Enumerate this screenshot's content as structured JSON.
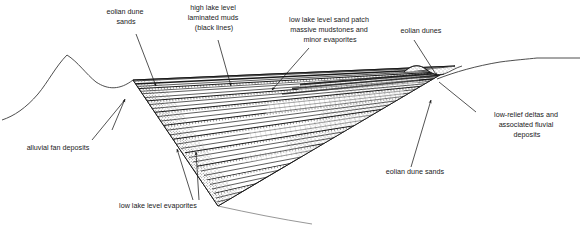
{
  "figure": {
    "type": "geological-cross-section",
    "background_color": "#ffffff",
    "line_color": "#1a1a1a",
    "stipple_color": "#555555",
    "width": 582,
    "height": 240
  },
  "labels": {
    "eolian_dune_sands_top": {
      "lines": [
        "eolian dune",
        "sands"
      ],
      "x": 126,
      "y": 14,
      "anchor": "middle"
    },
    "high_lake_level_muds": {
      "lines": [
        "high lake level",
        "laminated muds",
        "(black lines)"
      ],
      "x": 214,
      "y": 8,
      "anchor": "middle"
    },
    "low_lake_level_sand_patch": {
      "lines": [
        "low lake level sand patch",
        "massive mudstones and",
        "minor evaporites"
      ],
      "x": 330,
      "y": 22,
      "anchor": "middle"
    },
    "eolian_dunes_top_right": {
      "lines": [
        "eolian dunes"
      ],
      "x": 421,
      "y": 33,
      "anchor": "middle"
    },
    "low_relief_deltas": {
      "lines": [
        "low-relief deltas and",
        "associated fluvial",
        "deposits"
      ],
      "x": 527,
      "y": 117,
      "anchor": "middle"
    },
    "eolian_dune_sands_bottom": {
      "lines": [
        "eolian dune sands"
      ],
      "x": 415,
      "y": 174,
      "anchor": "middle"
    },
    "low_lake_level_evaporites": {
      "lines": [
        "low lake level evaporites"
      ],
      "x": 158,
      "y": 208,
      "anchor": "middle"
    },
    "alluvial_fan_deposits": {
      "lines": [
        "alluvial fan deposits"
      ],
      "x": 58,
      "y": 150,
      "anchor": "middle"
    }
  },
  "leaders": {
    "eolian_dune_sands_top": {
      "x1": 136,
      "y1": 34,
      "x2": 156,
      "y2": 86,
      "arrow": true
    },
    "high_lake_level_muds": {
      "x1": 218,
      "y1": 40,
      "x2": 231,
      "y2": 86,
      "arrow": true
    },
    "low_lake_level_sand_patch": {
      "x1": 309,
      "y1": 48,
      "x2": 272,
      "y2": 90,
      "arrow": true
    },
    "eolian_dunes_top_right": {
      "x1": 414,
      "y1": 40,
      "x2": 437,
      "y2": 78,
      "arrow": true
    },
    "low_relief_deltas": {
      "x1": 476,
      "y1": 112,
      "x2": 439,
      "y2": 82,
      "arrow": false
    },
    "eolian_dune_sands_bottom": {
      "x1": 411,
      "y1": 167,
      "x2": 431,
      "y2": 100,
      "arrow": true
    },
    "low_lake_level_evaporites_a": {
      "x1": 193,
      "y1": 200,
      "x2": 177,
      "y2": 149,
      "arrow": true
    },
    "low_lake_level_evaporites_b": {
      "x1": 199,
      "y1": 200,
      "x2": 196,
      "y2": 152,
      "arrow": true
    },
    "alluvial_fan_deposits": {
      "x1": 92,
      "y1": 140,
      "x2": 124,
      "y2": 101,
      "arrow": false
    }
  },
  "terrain": {
    "left_profile_label": "alluvial fan / hill profile",
    "right_profile_label": "basin margin ramp"
  },
  "units": [
    {
      "name": "eolian dune sands",
      "pattern": "stipple"
    },
    {
      "name": "high lake level laminated muds",
      "pattern": "black-lines"
    },
    {
      "name": "low lake level sand patch, massive mudstones and minor evaporites",
      "pattern": "hatch"
    },
    {
      "name": "low lake level evaporites",
      "pattern": "ladder-hatch"
    },
    {
      "name": "low-relief deltas and associated fluvial deposits",
      "pattern": "stipple"
    },
    {
      "name": "alluvial fan deposits",
      "pattern": "plain"
    }
  ]
}
